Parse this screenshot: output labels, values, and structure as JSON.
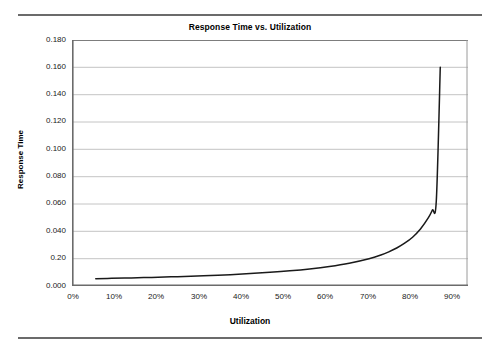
{
  "chart_data": {
    "type": "line",
    "title": "Response Time vs. Utilization",
    "xlabel": "Utilization",
    "ylabel": "Response Time",
    "xlim": [
      0,
      100
    ],
    "ylim": [
      0,
      0.18
    ],
    "grid": true,
    "legend": false,
    "x_tick_values": [
      0,
      10,
      20,
      30,
      40,
      50,
      60,
      70,
      80,
      90
    ],
    "x_tick_labels": [
      "0%",
      "10%",
      "20%",
      "30%",
      "40%",
      "50%",
      "60%",
      "70%",
      "80%",
      "90%"
    ],
    "y_tick_values": [
      0.0,
      0.02,
      0.04,
      0.06,
      0.08,
      0.1,
      0.12,
      0.14,
      0.16,
      0.18
    ],
    "y_tick_labels": [
      "0.000",
      "0.20",
      "0.040",
      "0.060",
      "0.080",
      "0.100",
      "0.120",
      "0.140",
      "0.160",
      "0.180"
    ],
    "series": [
      {
        "name": "Response Time",
        "x": [
          6,
          10,
          15,
          20,
          25,
          30,
          35,
          40,
          45,
          50,
          55,
          60,
          65,
          70,
          75,
          78,
          80,
          82,
          84,
          86,
          88,
          90,
          91,
          92,
          93
        ],
        "y": [
          0.0053,
          0.0056,
          0.0059,
          0.0063,
          0.0067,
          0.0071,
          0.0077,
          0.0083,
          0.0091,
          0.01,
          0.0111,
          0.0125,
          0.0143,
          0.0167,
          0.02,
          0.0227,
          0.025,
          0.0278,
          0.0313,
          0.0357,
          0.0417,
          0.05,
          0.0556,
          0.0625,
          0.16
        ],
        "color": "#1a1a1a"
      }
    ],
    "note": "Queueing response time curve; y tick at 0.020 is printed as 0.20 in the source chart"
  },
  "figure": {
    "top_rule": "",
    "bottom_rule": ""
  }
}
